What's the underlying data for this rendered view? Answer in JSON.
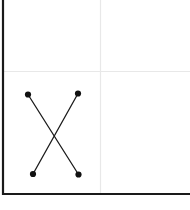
{
  "figure": {
    "width": 190,
    "height": 210,
    "background": "#ffffff"
  },
  "axes": {
    "left_spine": {
      "color": "#1a1a1a",
      "x": 3,
      "y_start": 0,
      "y_end": 195,
      "width": 2.2
    },
    "bottom_spine": {
      "color": "#1a1a1a",
      "y": 194,
      "x_start": 2,
      "x_end": 190,
      "width": 2.2
    }
  },
  "grid": {
    "color": "#e8e8e8",
    "width": 1.2,
    "vertical": [
      {
        "x": 100.5,
        "y_start": 0,
        "y_end": 193
      }
    ],
    "horizontal": [
      {
        "y": 71.5,
        "x_start": 4,
        "x_end": 190
      }
    ]
  },
  "chart_data": {
    "type": "line",
    "title": "",
    "subtitle": "",
    "xlabel": "",
    "ylabel": "",
    "xlim": [
      0,
      190
    ],
    "ylim": [
      210,
      0
    ],
    "grid": true,
    "legend": null,
    "marker": {
      "shape": "circle",
      "filled": true,
      "radius": 3.1,
      "color": "#111111"
    },
    "line": {
      "color": "#1b1b1b",
      "width": 1.3,
      "style": "solid"
    },
    "series": [
      {
        "name": "segment-1",
        "points": [
          {
            "x": 28,
            "y": 94.5
          },
          {
            "x": 78.5,
            "y": 174.5
          }
        ]
      },
      {
        "name": "segment-2",
        "points": [
          {
            "x": 78,
            "y": 93.5
          },
          {
            "x": 33,
            "y": 174
          }
        ]
      }
    ],
    "annotations": [],
    "tick_labels": {
      "x": [],
      "y": []
    },
    "crossing_point": {
      "x": 53,
      "y": 134
    }
  }
}
